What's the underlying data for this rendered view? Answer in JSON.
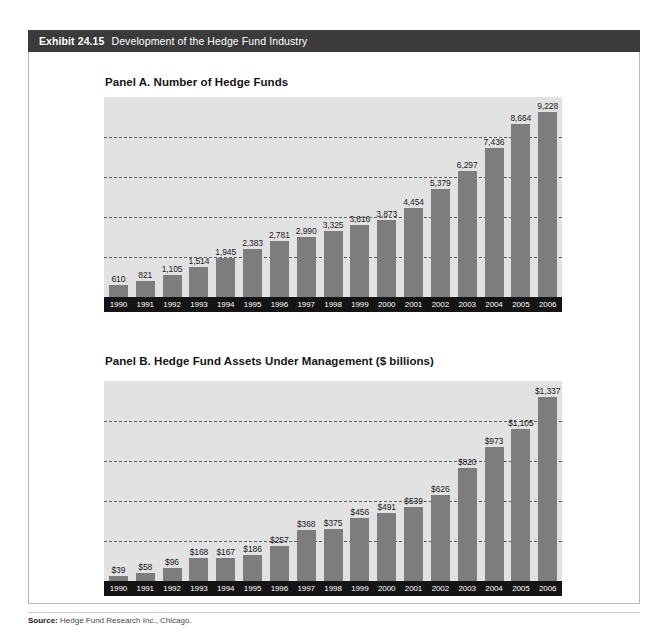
{
  "exhibit": {
    "label": "Exhibit 24.15",
    "title": "Development of the Hedge Fund Industry",
    "source_label": "Source:",
    "source_text": "Hedge Fund Research Inc., Chicago.",
    "colors": {
      "title_bar": "#3b3b3b",
      "plot_background": "#e2e2e2",
      "bar": "#7d7d7d",
      "axis_band": "#141414",
      "gridline": "#5f5f5f"
    }
  },
  "chart_data": [
    {
      "type": "bar",
      "title": "Panel A. Number of Hedge Funds",
      "xlabel": "",
      "ylabel": "",
      "ylim": [
        0,
        10000
      ],
      "grid": true,
      "gridlines": [
        2000,
        4000,
        6000,
        8000
      ],
      "legend": "none",
      "categories": [
        "1990",
        "1991",
        "1992",
        "1993",
        "1994",
        "1995",
        "1996",
        "1997",
        "1998",
        "1999",
        "2000",
        "2001",
        "2002",
        "2003",
        "2004",
        "2005",
        "2006"
      ],
      "values": [
        610,
        821,
        1105,
        1514,
        1945,
        2383,
        2781,
        2990,
        3325,
        3616,
        3873,
        4454,
        5379,
        6297,
        7436,
        8664,
        9228
      ],
      "labels": [
        "610",
        "821",
        "1,105",
        "1,514",
        "1,945",
        "2,383",
        "2,781",
        "2,990",
        "3,325",
        "3,616",
        "3,873",
        "4,454",
        "5,379",
        "6,297",
        "7,436",
        "8,664",
        "9,228"
      ]
    },
    {
      "type": "bar",
      "title": "Panel B.  Hedge Fund Assets Under Management ($ billions)",
      "xlabel": "",
      "ylabel": "$ billions",
      "ylim": [
        0,
        1450
      ],
      "grid": true,
      "gridlines": [
        290,
        580,
        870,
        1160
      ],
      "legend": "none",
      "categories": [
        "1990",
        "1991",
        "1992",
        "1993",
        "1994",
        "1995",
        "1996",
        "1997",
        "1998",
        "1999",
        "2000",
        "2001",
        "2002",
        "2003",
        "2004",
        "2005",
        "2006"
      ],
      "values": [
        39,
        58,
        96,
        168,
        167,
        186,
        257,
        368,
        375,
        456,
        491,
        539,
        626,
        820,
        973,
        1105,
        1337
      ],
      "labels": [
        "$39",
        "$58",
        "$96",
        "$168",
        "$167",
        "$186",
        "$257",
        "$368",
        "$375",
        "$456",
        "$491",
        "$539",
        "$626",
        "$820",
        "$973",
        "$1,105",
        "$1,337"
      ]
    }
  ]
}
